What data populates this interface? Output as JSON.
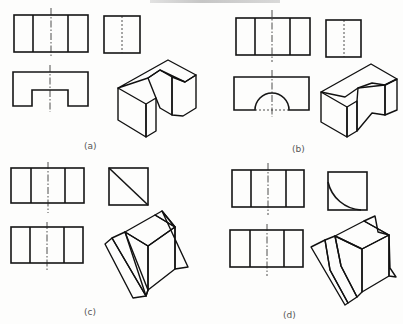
{
  "figure": {
    "header_fragment": "",
    "panels": [
      {
        "id": "a",
        "caption": "(a)",
        "caption_pos": [
          84,
          149
        ],
        "front_view": {
          "rect": [
            14,
            15,
            74,
            37
          ],
          "verticals": [
            33,
            68
          ],
          "center_x": 51,
          "center_y": [
            8,
            58
          ]
        },
        "side_view": {
          "rect": [
            104,
            16,
            36,
            37
          ],
          "center_x": 122,
          "center_y": [
            16,
            53
          ],
          "feature": "hidden-line"
        },
        "top_view": {
          "outline": [
            [
              13,
              72
            ],
            [
              88,
              72
            ],
            [
              88,
              106
            ],
            [
              68,
              106
            ],
            [
              68,
              90
            ],
            [
              32,
              90
            ],
            [
              32,
              106
            ],
            [
              13,
              106
            ]
          ],
          "center_x": 50,
          "center_y": [
            65,
            112
          ]
        },
        "iso_solid": {
          "shape": "u-channel-block",
          "faces": [
            {
              "name": "top",
              "fill": "#d8d8d8",
              "points": [
                [
                  118,
                  88
                ],
                [
                  168,
                  60
                ],
                [
                  196,
                  75
                ],
                [
                  185,
                  82
                ],
                [
                  160,
                  70
                ],
                [
                  148,
                  78
                ]
              ]
            },
            {
              "name": "front-left",
              "fill": "#9a9a9a",
              "points": [
                [
                  118,
                  88
                ],
                [
                  146,
                  104
                ],
                [
                  146,
                  137
                ],
                [
                  118,
                  120
                ]
              ]
            },
            {
              "name": "front-right",
              "fill": "#7c7c7c",
              "points": [
                [
                  146,
                  104
                ],
                [
                  156,
                  98
                ],
                [
                  156,
                  131
                ],
                [
                  146,
                  137
                ]
              ]
            },
            {
              "name": "notch-back",
              "fill": "#3c3c3c",
              "points": [
                [
                  148,
                  78
                ],
                [
                  160,
                  70
                ],
                [
                  172,
                  77
                ],
                [
                  172,
                  115
                ],
                [
                  160,
                  108
                ],
                [
                  156,
                  98
                ]
              ]
            },
            {
              "name": "right-end",
              "fill": "#6a6a6a",
              "points": [
                [
                  172,
                  77
                ],
                [
                  185,
                  82
                ],
                [
                  196,
                  75
                ],
                [
                  196,
                  108
                ],
                [
                  183,
                  116
                ],
                [
                  172,
                  115
                ]
              ]
            }
          ]
        }
      },
      {
        "id": "b",
        "caption": "(b)",
        "caption_pos": [
          292,
          152
        ],
        "front_view": {
          "rect": [
            236,
            18,
            74,
            37
          ],
          "verticals": [
            255,
            290
          ],
          "center_x": 272,
          "center_y": [
            10,
            62
          ]
        },
        "side_view": {
          "rect": [
            326,
            20,
            35,
            37
          ],
          "center_x": 344,
          "center_y": [
            20,
            57
          ],
          "feature": "hidden-line"
        },
        "top_view": {
          "rect": [
            234,
            77,
            75,
            33
          ],
          "semicircle": {
            "cx": 272,
            "cy": 110,
            "r": 17
          },
          "center_x": 272,
          "center_y": [
            70,
            117
          ]
        },
        "iso_solid": {
          "shape": "block-with-semicircular-cutout",
          "faces": [
            {
              "name": "top",
              "fill": "#d4d4d4",
              "points": [
                [
                  321,
                  92
                ],
                [
                  371,
                  64
                ],
                [
                  397,
                  79
                ],
                [
                  385,
                  85
                ],
                [
                  358,
                  88
                ],
                [
                  345,
                  97
                ]
              ]
            },
            {
              "name": "front",
              "fill": "#9a9a9a",
              "points": [
                [
                  321,
                  92
                ],
                [
                  347,
                  107
                ],
                [
                  347,
                  137
                ],
                [
                  321,
                  122
                ]
              ]
            },
            {
              "name": "cutout-front",
              "fill": "#7a7a7a",
              "points": [
                [
                  347,
                  107
                ],
                [
                  357,
                  101
                ],
                [
                  357,
                  131
                ],
                [
                  347,
                  137
                ]
              ]
            },
            {
              "name": "cutout-curve",
              "fill": "#454545",
              "points": [
                [
                  357,
                  101
                ],
                [
                  358,
                  88
                ],
                [
                  372,
                  83
                ],
                [
                  385,
                  85
                ],
                [
                  385,
                  115
                ],
                [
                  372,
                  113
                ],
                [
                  357,
                  131
                ]
              ]
            },
            {
              "name": "right-end",
              "fill": "#6e6e6e",
              "points": [
                [
                  385,
                  85
                ],
                [
                  397,
                  79
                ],
                [
                  397,
                  110
                ],
                [
                  385,
                  115
                ]
              ]
            }
          ]
        }
      },
      {
        "id": "c",
        "caption": "(c)",
        "caption_pos": [
          84,
          315
        ],
        "front_view": {
          "rect": [
            11,
            168,
            73,
            35
          ],
          "verticals": [
            31,
            65
          ],
          "center_x": 48,
          "center_y": [
            162,
            213
          ]
        },
        "side_view": {
          "rect": [
            109,
            168,
            39,
            37
          ],
          "diagonal": [
            [
              109,
              168
            ],
            [
              148,
              205
            ]
          ]
        },
        "top_view": {
          "rect": [
            11,
            227,
            72,
            36
          ],
          "verticals": [
            30,
            64
          ],
          "center_x": 47,
          "center_y": [
            222,
            272
          ]
        },
        "iso_solid": {
          "shape": "cube-on-triangular-prism",
          "faces": [
            {
              "name": "prism-left",
              "fill": "#b8b8b8",
              "points": [
                [
                  105,
                  244
                ],
                [
                  112,
                  238
                ],
                [
                  146,
                  296
                ],
                [
                  133,
                  298
                ]
              ]
            },
            {
              "name": "prism-slant",
              "fill": "#7d7d7d",
              "points": [
                [
                  112,
                  238
                ],
                [
                  125,
                  232
                ],
                [
                  148,
                  290
                ],
                [
                  146,
                  296
                ]
              ]
            },
            {
              "name": "cube-left",
              "fill": "#a6a6a6",
              "points": [
                [
                  125,
                  232
                ],
                [
                  148,
                  246
                ],
                [
                  148,
                  290
                ],
                [
                  146,
                  296
                ]
              ]
            },
            {
              "name": "cube-top",
              "fill": "#c9c9c9",
              "points": [
                [
                  125,
                  232
                ],
                [
                  155,
                  215
                ],
                [
                  175,
                  227
                ],
                [
                  148,
                  246
                ]
              ]
            },
            {
              "name": "prism-top-back",
              "fill": "#bdbdbd",
              "points": [
                [
                  155,
                  215
                ],
                [
                  162,
                  211
                ],
                [
                  175,
                  227
                ]
              ]
            },
            {
              "name": "cube-right",
              "fill": "#7f7f7f",
              "points": [
                [
                  148,
                  246
                ],
                [
                  175,
                  227
                ],
                [
                  175,
                  269
                ],
                [
                  148,
                  290
                ]
              ]
            },
            {
              "name": "prism-right",
              "fill": "#a8a8a8",
              "points": [
                [
                  175,
                  227
                ],
                [
                  162,
                  211
                ],
                [
                  188,
                  267
                ],
                [
                  175,
                  269
                ]
              ]
            }
          ]
        }
      },
      {
        "id": "d",
        "caption": "(d)",
        "caption_pos": [
          283,
          318
        ],
        "front_view": {
          "rect": [
            232,
            170,
            72,
            37
          ],
          "verticals": [
            251,
            286
          ],
          "center_x": 268,
          "center_y": [
            163,
            215
          ]
        },
        "side_view": {
          "rect": [
            328,
            172,
            39,
            38
          ],
          "arc": {
            "from": [
              328,
              182
            ],
            "to": [
              361,
              210
            ],
            "r": 36
          }
        },
        "top_view": {
          "rect": [
            230,
            230,
            73,
            37
          ],
          "verticals": [
            250,
            284
          ],
          "center_x": 267,
          "center_y": [
            224,
            276
          ]
        },
        "iso_solid": {
          "shape": "cube-on-concave-quarter-prism",
          "faces": [
            {
              "name": "curve-face-left",
              "fill": "#5e5e5e",
              "points": [
                [
                  311,
                  247
                ],
                [
                  325,
                  240
                ],
                [
                  330,
                  270
                ],
                [
                  348,
                  303
                ],
                [
                  345,
                  305
                ]
              ]
            },
            {
              "name": "curve-face",
              "fill": "#6d6d6d",
              "points": [
                [
                  325,
                  240
                ],
                [
                  335,
                  236
                ],
                [
                  341,
                  266
                ],
                [
                  357,
                  297
                ],
                [
                  348,
                  303
                ],
                [
                  330,
                  270
                ]
              ]
            },
            {
              "name": "cube-left",
              "fill": "#545454",
              "points": [
                [
                  335,
                  236
                ],
                [
                  362,
                  249
                ],
                [
                  362,
                  292
                ],
                [
                  357,
                  297
                ],
                [
                  341,
                  266
                ]
              ]
            },
            {
              "name": "cube-top",
              "fill": "#7b7b7b",
              "points": [
                [
                  335,
                  236
                ],
                [
                  364,
                  221
                ],
                [
                  389,
                  235
                ],
                [
                  362,
                  249
                ]
              ]
            },
            {
              "name": "cube-right",
              "fill": "#474747",
              "points": [
                [
                  362,
                  249
                ],
                [
                  389,
                  235
                ],
                [
                  389,
                  276
                ],
                [
                  362,
                  292
                ]
              ]
            },
            {
              "name": "fin-back",
              "fill": "#8a8a8a",
              "points": [
                [
                  364,
                  221
                ],
                [
                  375,
                  216
                ],
                [
                  378,
                  232
                ],
                [
                  389,
                  235
                ]
              ]
            },
            {
              "name": "fin-right",
              "fill": "#6a6a6a",
              "points": [
                [
                  389,
                  235
                ],
                [
                  389,
                  276
                ],
                [
                  396,
                  277
                ],
                [
                  390,
                  268
                ]
              ]
            }
          ]
        }
      }
    ]
  }
}
